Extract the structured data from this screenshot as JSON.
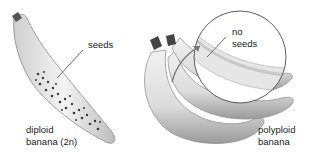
{
  "figure": {
    "left_panel": {
      "callout": "seeds",
      "caption_line1": "diploid",
      "caption_line2": "banana (2n)"
    },
    "right_panel": {
      "callout_line1": "no",
      "callout_line2": "seeds",
      "caption_line1": "polyploid",
      "caption_line2": "banana"
    }
  }
}
